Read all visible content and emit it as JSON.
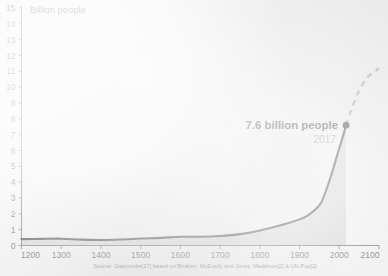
{
  "figure": {
    "background_color": "#f2f2f2",
    "axis_color": "#5a5a5a",
    "line_color": "#1c1c1c",
    "projection_color": "#9a9a9a",
    "fill_color": "#cfcfcf",
    "y_axis_title": "Billion people",
    "source_note": "Source: Gapminder[17] based on Biraben, McEvedy and Jones, Maddison[2] & UN-Pop[1]",
    "annotation": {
      "value_label": "7.6 billion people",
      "year_label": "2017",
      "marker_name": "data-point-marker"
    }
  },
  "chart_data": {
    "type": "line",
    "title": "",
    "xlabel": "",
    "ylabel": "Billion people",
    "xlim": [
      1200,
      2100
    ],
    "ylim": [
      0,
      15
    ],
    "grid": false,
    "legend": "none",
    "xticks": [
      1200,
      1300,
      1400,
      1500,
      1600,
      1700,
      1800,
      1900,
      2000,
      2100
    ],
    "yticks": [
      0,
      1,
      2,
      3,
      4,
      5,
      6,
      7,
      8,
      9,
      10,
      11,
      12,
      13,
      14,
      15
    ],
    "series": [
      {
        "name": "World population (historical)",
        "style": "solid",
        "area_filled": true,
        "x": [
          1200,
          1250,
          1300,
          1350,
          1400,
          1450,
          1500,
          1550,
          1600,
          1650,
          1700,
          1750,
          1800,
          1850,
          1900,
          1925,
          1950,
          1960,
          1970,
          1980,
          1990,
          2000,
          2010,
          2017
        ],
        "y": [
          0.4,
          0.42,
          0.43,
          0.37,
          0.35,
          0.38,
          0.44,
          0.48,
          0.55,
          0.55,
          0.6,
          0.72,
          0.95,
          1.26,
          1.65,
          1.97,
          2.54,
          3.03,
          3.7,
          4.45,
          5.3,
          6.14,
          6.96,
          7.6
        ]
      },
      {
        "name": "UN projection",
        "style": "dashed",
        "area_filled": false,
        "x": [
          2017,
          2030,
          2050,
          2070,
          2090,
          2100
        ],
        "y": [
          7.6,
          8.55,
          9.77,
          10.6,
          11.0,
          11.2
        ]
      }
    ],
    "annotations": [
      {
        "x": 2017,
        "y": 7.6,
        "text": "7.6 billion people",
        "subtext": "2017"
      }
    ]
  }
}
